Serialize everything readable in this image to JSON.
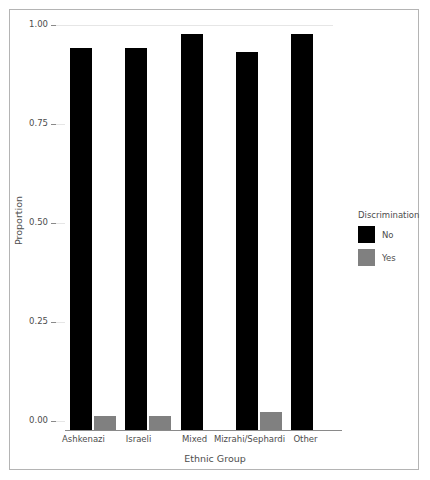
{
  "chart_data": {
    "type": "bar",
    "title": "",
    "subtitle": "",
    "xlabel": "Ethnic Group",
    "ylabel": "Proportion",
    "categories": [
      "Ashkenazi",
      "Israeli",
      "Mixed",
      "Mizrahi/Sephardi",
      "Other"
    ],
    "series": [
      {
        "name": "No",
        "color": "#000000",
        "values": [
          0.965,
          0.965,
          1.0,
          0.955,
          1.0
        ]
      },
      {
        "name": "Yes",
        "color": "#808080",
        "values": [
          0.035,
          0.035,
          0.0,
          0.045,
          0.0
        ]
      }
    ],
    "legend": {
      "title": "Discrimination",
      "position": "right",
      "entries": [
        "No",
        "Yes"
      ]
    },
    "ylim": [
      0.0,
      1.0
    ],
    "ytick_labels": [
      "0.00",
      "0.25",
      "0.50",
      "0.75",
      "1.00"
    ],
    "ytick_values": [
      0.0,
      0.25,
      0.5,
      0.75,
      1.0
    ],
    "grid": "horizontal",
    "grid_color": "#e6e6e6",
    "axis_color": "#8a8a8a",
    "background": "#ffffff",
    "border_color": "#b4b4b4"
  }
}
